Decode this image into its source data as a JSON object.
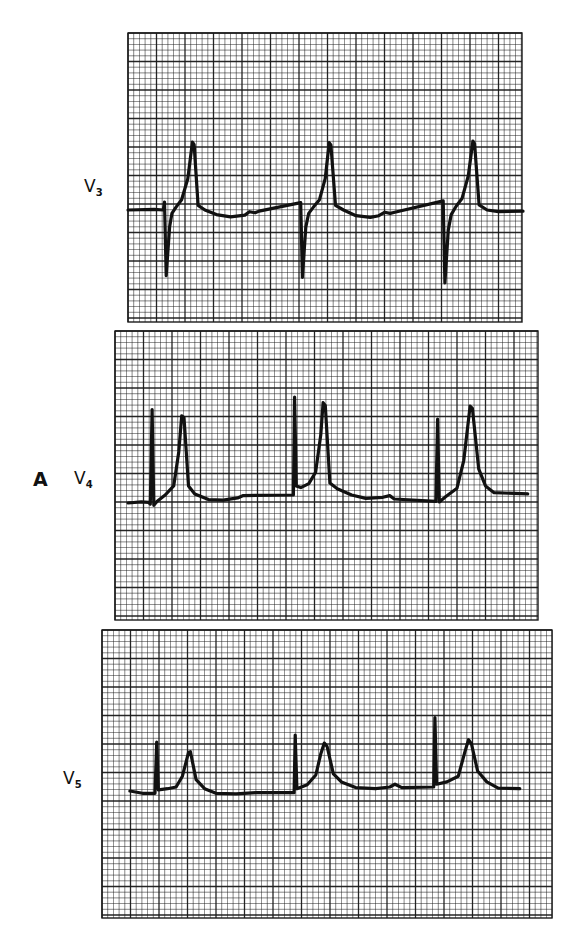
{
  "panel_label": "A",
  "chart_data": {
    "type": "line",
    "title": "",
    "grid": true,
    "grid_style": {
      "minor_per_major": 5,
      "line_color": "#1a1a1a",
      "paper_color": "#ffffff"
    },
    "trace_color": "#111111",
    "leads": [
      {
        "name": "V3",
        "label_main": "V",
        "label_sub": "3",
        "beats": 3,
        "amplitude_units": "small squares relative to baseline (positive = up)",
        "time_units": "small squares from strip left edge",
        "trace": [
          [
            0.0,
            0.0
          ],
          [
            4.6,
            0.1
          ],
          [
            6.2,
            0.0
          ],
          [
            6.4,
            1.4
          ],
          [
            6.7,
            -11.5
          ],
          [
            7.3,
            -3.0
          ],
          [
            7.7,
            -0.6
          ],
          [
            8.5,
            0.6
          ],
          [
            9.4,
            1.8
          ],
          [
            10.5,
            5.5
          ],
          [
            11.3,
            11.9
          ],
          [
            11.6,
            11.5
          ],
          [
            12.3,
            0.8
          ],
          [
            13.5,
            0.0
          ],
          [
            15.5,
            -0.8
          ],
          [
            18.0,
            -1.2
          ],
          [
            20.5,
            -0.9
          ],
          [
            21.3,
            -0.3
          ],
          [
            22.3,
            -0.5
          ],
          [
            23.0,
            -0.2
          ],
          [
            30.3,
            1.3
          ],
          [
            30.6,
            -11.8
          ],
          [
            31.2,
            -3.0
          ],
          [
            31.7,
            -0.6
          ],
          [
            32.6,
            0.6
          ],
          [
            33.6,
            1.8
          ],
          [
            34.6,
            5.5
          ],
          [
            35.3,
            11.8
          ],
          [
            35.6,
            11.4
          ],
          [
            36.4,
            0.8
          ],
          [
            37.8,
            0.0
          ],
          [
            40.0,
            -1.0
          ],
          [
            42.5,
            -1.3
          ],
          [
            44.0,
            -1.0
          ],
          [
            45.0,
            -0.4
          ],
          [
            46.0,
            -0.6
          ],
          [
            46.8,
            -0.4
          ],
          [
            55.3,
            1.6
          ],
          [
            55.6,
            -12.8
          ],
          [
            56.2,
            -3.5
          ],
          [
            56.7,
            -0.8
          ],
          [
            57.6,
            0.7
          ],
          [
            58.6,
            2.0
          ],
          [
            59.7,
            6.0
          ],
          [
            60.5,
            12.1
          ],
          [
            60.8,
            11.6
          ],
          [
            61.6,
            0.9
          ],
          [
            63.0,
            0.0
          ],
          [
            65.0,
            -0.3
          ],
          [
            69.3,
            -0.2
          ]
        ]
      },
      {
        "name": "V4",
        "label_main": "V",
        "label_sub": "4",
        "beats": 3,
        "amplitude_units": "small squares relative to baseline (positive = up)",
        "time_units": "small squares from strip left edge",
        "trace": [
          [
            2.3,
            0.0
          ],
          [
            4.6,
            0.2
          ],
          [
            5.9,
            0.1
          ],
          [
            6.2,
            -0.2
          ],
          [
            6.5,
            16.4
          ],
          [
            6.8,
            -0.4
          ],
          [
            7.4,
            0.3
          ],
          [
            8.8,
            1.4
          ],
          [
            10.3,
            3.0
          ],
          [
            11.2,
            9.0
          ],
          [
            11.7,
            15.3
          ],
          [
            12.1,
            15.0
          ],
          [
            12.9,
            3.0
          ],
          [
            14.0,
            1.6
          ],
          [
            16.4,
            0.6
          ],
          [
            19.0,
            0.5
          ],
          [
            21.5,
            0.9
          ],
          [
            22.5,
            1.3
          ],
          [
            31.3,
            1.4
          ],
          [
            31.5,
            18.6
          ],
          [
            31.8,
            3.0
          ],
          [
            32.6,
            2.7
          ],
          [
            34.0,
            3.4
          ],
          [
            35.2,
            5.4
          ],
          [
            36.1,
            12.0
          ],
          [
            36.5,
            17.6
          ],
          [
            36.9,
            17.1
          ],
          [
            37.7,
            3.5
          ],
          [
            39.0,
            2.5
          ],
          [
            41.5,
            1.4
          ],
          [
            44.0,
            0.8
          ],
          [
            47.0,
            1.0
          ],
          [
            48.2,
            1.3
          ],
          [
            49.0,
            0.7
          ],
          [
            56.3,
            0.3
          ],
          [
            56.6,
            14.7
          ],
          [
            56.9,
            0.2
          ],
          [
            58.0,
            1.1
          ],
          [
            60.0,
            2.6
          ],
          [
            61.2,
            7.5
          ],
          [
            62.3,
            17.0
          ],
          [
            62.7,
            16.6
          ],
          [
            63.8,
            6.0
          ],
          [
            65.0,
            3.0
          ],
          [
            66.5,
            1.8
          ],
          [
            72.4,
            1.6
          ]
        ]
      },
      {
        "name": "V5",
        "label_main": "V",
        "label_sub": "5",
        "beats": 3,
        "amplitude_units": "small squares relative to baseline (positive = up)",
        "time_units": "small squares from strip left edge",
        "trace": [
          [
            4.9,
            0.0
          ],
          [
            7.1,
            -0.4
          ],
          [
            9.3,
            -0.4
          ],
          [
            9.6,
            8.6
          ],
          [
            9.9,
            0.2
          ],
          [
            11.5,
            0.4
          ],
          [
            13.0,
            0.7
          ],
          [
            14.1,
            2.6
          ],
          [
            15.2,
            6.8
          ],
          [
            15.5,
            6.9
          ],
          [
            16.5,
            2.0
          ],
          [
            18.0,
            0.4
          ],
          [
            20.0,
            -0.4
          ],
          [
            23.5,
            -0.5
          ],
          [
            27.0,
            -0.3
          ],
          [
            33.7,
            -0.3
          ],
          [
            33.9,
            9.8
          ],
          [
            34.2,
            0.4
          ],
          [
            36.0,
            1.1
          ],
          [
            37.5,
            2.8
          ],
          [
            38.4,
            6.6
          ],
          [
            39.0,
            8.4
          ],
          [
            39.5,
            7.8
          ],
          [
            40.6,
            3.0
          ],
          [
            42.0,
            1.6
          ],
          [
            44.5,
            0.6
          ],
          [
            48.0,
            0.4
          ],
          [
            50.5,
            0.7
          ],
          [
            51.4,
            1.2
          ],
          [
            52.6,
            0.6
          ],
          [
            58.2,
            0.7
          ],
          [
            58.4,
            12.9
          ],
          [
            58.7,
            1.2
          ],
          [
            60.5,
            1.6
          ],
          [
            62.5,
            2.6
          ],
          [
            63.7,
            7.0
          ],
          [
            64.3,
            9.0
          ],
          [
            64.8,
            8.3
          ],
          [
            65.9,
            3.5
          ],
          [
            67.5,
            1.6
          ],
          [
            69.5,
            0.5
          ],
          [
            73.3,
            0.4
          ]
        ]
      }
    ]
  }
}
